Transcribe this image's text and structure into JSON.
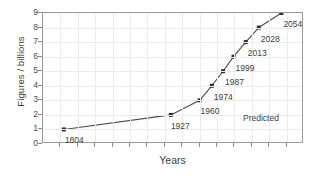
{
  "chart_data": {
    "type": "line",
    "title": "",
    "xlabel": "Years",
    "ylabel": "Figures / billions",
    "xlim": [
      1780,
      2080
    ],
    "ylim": [
      0,
      9
    ],
    "grid": true,
    "legend": false,
    "x": [
      1804,
      1927,
      1960,
      1974,
      1987,
      1999,
      2013,
      2028,
      2054
    ],
    "values": [
      1,
      2,
      3,
      4,
      5,
      6,
      7,
      8,
      9
    ],
    "point_labels": [
      "1804",
      "1927",
      "1960",
      "1974",
      "1987",
      "1999",
      "2013",
      "2028",
      "2054"
    ],
    "y_ticks": [
      0,
      1,
      2,
      3,
      4,
      5,
      6,
      7,
      8,
      9
    ],
    "y_tick_labels": [
      "0",
      "1",
      "2",
      "3",
      "4",
      "5",
      "6",
      "7",
      "8",
      "9"
    ],
    "x_ticks": [
      1800,
      1820,
      1840,
      1860,
      1880,
      1900,
      1920,
      1940,
      1960,
      1980,
      2000,
      2020,
      2040,
      2060
    ],
    "x_tick_labels": [
      "",
      "",
      "",
      "",
      "",
      "",
      "",
      "",
      "",
      "",
      "",
      "",
      "",
      ""
    ],
    "annotations": [
      {
        "text": "Predicted",
        "x_px": 243,
        "y_px": 114
      }
    ],
    "series_color": "#4a4a4a",
    "marker_color": "#2e2e2e",
    "grid_color": "#ebebeb",
    "axis_color": "#9a9a9a",
    "background": "#ffffff"
  },
  "labels": {
    "y_axis_title": "Figures / billions",
    "x_axis_title": "Years",
    "predicted": "Predicted"
  }
}
